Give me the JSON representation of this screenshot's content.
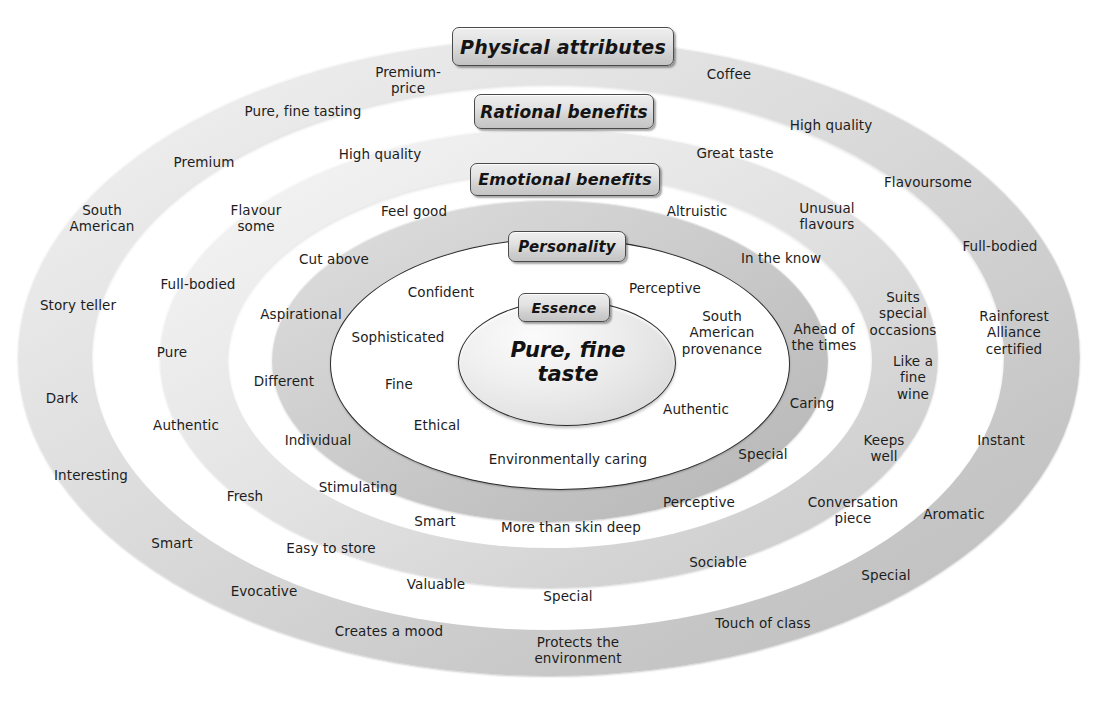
{
  "diagram": {
    "type": "concentric-ellipse-brand-model",
    "core_text": "Pure, fine\ntaste",
    "layer_labels": {
      "physical": "Physical attributes",
      "rational": "Rational benefits",
      "emotional": "Emotional benefits",
      "personality": "Personality",
      "essence": "Essence"
    },
    "colors": {
      "outer_band": "#d9d9d9",
      "rational_band": "#e2e2e2",
      "emotional_band": "#c9c9c9",
      "personality_fill": "#ffffff",
      "essence_fill": "#e6e6e6",
      "label_box": "#d8d8d8",
      "text": "#1d1d1d",
      "outline": "#2b2b2b"
    },
    "layers": [
      {
        "name": "essence",
        "label": "Essence",
        "words": [
          "Pure, fine taste"
        ]
      },
      {
        "name": "personality",
        "label": "Personality",
        "words": [
          "Confident",
          "Perceptive",
          "Sophisticated",
          "South\nAmerican\nprovenance",
          "Fine",
          "Ethical",
          "Authentic",
          "Environmentally caring"
        ]
      },
      {
        "name": "emotional",
        "label": "Emotional benefits",
        "words": [
          "Cut above",
          "Aspirational",
          "Different",
          "Individual",
          "Stimulating",
          "Smart",
          "More than skin deep",
          "Perceptive",
          "Special",
          "Caring",
          "Ahead of\nthe times",
          "In the know"
        ]
      },
      {
        "name": "emotional_gap",
        "label": "",
        "words": [
          "Feel good",
          "Altruistic",
          "Flavour\nsome",
          "Unusual\nflavours",
          "High quality",
          "Great taste"
        ]
      },
      {
        "name": "rational",
        "label": "Rational benefits",
        "words": [
          "Premium-\nprice",
          "Coffee",
          "Pure, fine tasting",
          "High quality",
          "Flavoursome",
          "Suits\nspecial\noccasions",
          "Like a\nfine\nwine",
          "Keeps\nwell",
          "Conversation\npiece",
          "Sociable",
          "Special",
          "Valuable",
          "Easy to store",
          "Fresh",
          "Authentic",
          "Pure",
          "Full-bodied",
          "Premium"
        ]
      },
      {
        "name": "physical",
        "label": "Physical attributes",
        "words": [
          "South\nAmerican",
          "Story teller",
          "Dark",
          "Interesting",
          "Smart",
          "Evocative",
          "Creates a mood",
          "Protects the\nenvironment",
          "Touch of class",
          "Special",
          "Aromatic",
          "Instant",
          "Rainforest\nAlliance\ncertified",
          "Full-bodied",
          "Flavoursome"
        ]
      }
    ],
    "word_placements": [
      {
        "id": "w-premium-price",
        "text": "Premium-\nprice",
        "x": 408,
        "y": 80,
        "ring": "physical"
      },
      {
        "id": "w-coffee",
        "text": "Coffee",
        "x": 729,
        "y": 74,
        "ring": "physical"
      },
      {
        "id": "w-pure-fine-tasting",
        "text": "Pure, fine tasting",
        "x": 303,
        "y": 111,
        "ring": "physical"
      },
      {
        "id": "w-high-quality-r",
        "text": "High quality",
        "x": 831,
        "y": 125,
        "ring": "physical"
      },
      {
        "id": "w-premium",
        "text": "Premium",
        "x": 204,
        "y": 162,
        "ring": "physical"
      },
      {
        "id": "w-high-quality-l",
        "text": "High quality",
        "x": 380,
        "y": 154,
        "ring": "rational"
      },
      {
        "id": "w-great-taste",
        "text": "Great taste",
        "x": 735,
        "y": 153,
        "ring": "rational"
      },
      {
        "id": "w-flavoursome-out",
        "text": "Flavoursome",
        "x": 928,
        "y": 182,
        "ring": "physical"
      },
      {
        "id": "w-south-american-out",
        "text": "South\nAmerican",
        "x": 102,
        "y": 218,
        "ring": "physical"
      },
      {
        "id": "w-flavour-some",
        "text": "Flavour\nsome",
        "x": 256,
        "y": 218,
        "ring": "rational"
      },
      {
        "id": "w-feel-good",
        "text": "Feel good",
        "x": 414,
        "y": 211,
        "ring": "rational"
      },
      {
        "id": "w-altruistic",
        "text": "Altruistic",
        "x": 697,
        "y": 211,
        "ring": "rational"
      },
      {
        "id": "w-unusual-flavours",
        "text": "Unusual\nflavours",
        "x": 827,
        "y": 216,
        "ring": "rational"
      },
      {
        "id": "w-full-bodied-out",
        "text": "Full-bodied",
        "x": 1000,
        "y": 246,
        "ring": "physical"
      },
      {
        "id": "w-cut-above",
        "text": "Cut above",
        "x": 334,
        "y": 259,
        "ring": "emotional"
      },
      {
        "id": "w-in-the-know",
        "text": "In the know",
        "x": 781,
        "y": 258,
        "ring": "emotional"
      },
      {
        "id": "w-story-teller",
        "text": "Story teller",
        "x": 78,
        "y": 305,
        "ring": "physical"
      },
      {
        "id": "w-full-bodied-mid",
        "text": "Full-bodied",
        "x": 198,
        "y": 284,
        "ring": "rational"
      },
      {
        "id": "w-confident",
        "text": "Confident",
        "x": 441,
        "y": 292,
        "ring": "personality"
      },
      {
        "id": "w-perceptive-in",
        "text": "Perceptive",
        "x": 665,
        "y": 288,
        "ring": "personality"
      },
      {
        "id": "w-aspirational",
        "text": "Aspirational",
        "x": 301,
        "y": 314,
        "ring": "emotional"
      },
      {
        "id": "w-suits-special",
        "text": "Suits\nspecial\noccasions",
        "x": 903,
        "y": 314,
        "ring": "rational"
      },
      {
        "id": "w-rainforest",
        "text": "Rainforest\nAlliance\ncertified",
        "x": 1014,
        "y": 333,
        "ring": "physical"
      },
      {
        "id": "w-sophisticated",
        "text": "Sophisticated",
        "x": 398,
        "y": 337,
        "ring": "personality"
      },
      {
        "id": "w-south-am-prov",
        "text": "South\nAmerican\nprovenance",
        "x": 722,
        "y": 333,
        "ring": "personality"
      },
      {
        "id": "w-ahead-of-times",
        "text": "Ahead of\nthe times",
        "x": 824,
        "y": 337,
        "ring": "emotional"
      },
      {
        "id": "w-pure",
        "text": "Pure",
        "x": 172,
        "y": 352,
        "ring": "rational"
      },
      {
        "id": "w-dark",
        "text": "Dark",
        "x": 62,
        "y": 398,
        "ring": "physical"
      },
      {
        "id": "w-different",
        "text": "Different",
        "x": 284,
        "y": 381,
        "ring": "emotional"
      },
      {
        "id": "w-fine",
        "text": "Fine",
        "x": 399,
        "y": 384,
        "ring": "personality"
      },
      {
        "id": "w-like-fine-wine",
        "text": "Like a\nfine\nwine",
        "x": 913,
        "y": 378,
        "ring": "rational"
      },
      {
        "id": "w-ethical",
        "text": "Ethical",
        "x": 437,
        "y": 425,
        "ring": "personality"
      },
      {
        "id": "w-authentic-in",
        "text": "Authentic",
        "x": 696,
        "y": 409,
        "ring": "personality"
      },
      {
        "id": "w-caring",
        "text": "Caring",
        "x": 812,
        "y": 403,
        "ring": "emotional"
      },
      {
        "id": "w-authentic-mid",
        "text": "Authentic",
        "x": 186,
        "y": 425,
        "ring": "rational"
      },
      {
        "id": "w-individual",
        "text": "Individual",
        "x": 318,
        "y": 440,
        "ring": "emotional"
      },
      {
        "id": "w-instant",
        "text": "Instant",
        "x": 1001,
        "y": 440,
        "ring": "physical"
      },
      {
        "id": "w-env-caring",
        "text": "Environmentally caring",
        "x": 568,
        "y": 459,
        "ring": "personality"
      },
      {
        "id": "w-special-emo",
        "text": "Special",
        "x": 763,
        "y": 454,
        "ring": "emotional"
      },
      {
        "id": "w-keeps-well",
        "text": "Keeps\nwell",
        "x": 884,
        "y": 448,
        "ring": "rational"
      },
      {
        "id": "w-interesting",
        "text": "Interesting",
        "x": 91,
        "y": 475,
        "ring": "physical"
      },
      {
        "id": "w-stimulating",
        "text": "Stimulating",
        "x": 358,
        "y": 487,
        "ring": "emotional"
      },
      {
        "id": "w-fresh",
        "text": "Fresh",
        "x": 245,
        "y": 496,
        "ring": "rational"
      },
      {
        "id": "w-perceptive-emo",
        "text": "Perceptive",
        "x": 699,
        "y": 502,
        "ring": "emotional"
      },
      {
        "id": "w-conversation",
        "text": "Conversation\npiece",
        "x": 853,
        "y": 510,
        "ring": "rational"
      },
      {
        "id": "w-aromatic",
        "text": "Aromatic",
        "x": 954,
        "y": 514,
        "ring": "physical"
      },
      {
        "id": "w-smart-emo",
        "text": "Smart",
        "x": 435,
        "y": 521,
        "ring": "emotional"
      },
      {
        "id": "w-more-than-skin",
        "text": "More than skin deep",
        "x": 571,
        "y": 527,
        "ring": "emotional"
      },
      {
        "id": "w-smart-out",
        "text": "Smart",
        "x": 172,
        "y": 543,
        "ring": "physical"
      },
      {
        "id": "w-easy-to-store",
        "text": "Easy to store",
        "x": 331,
        "y": 548,
        "ring": "rational"
      },
      {
        "id": "w-sociable",
        "text": "Sociable",
        "x": 718,
        "y": 562,
        "ring": "rational"
      },
      {
        "id": "w-special-out-r",
        "text": "Special",
        "x": 886,
        "y": 575,
        "ring": "physical"
      },
      {
        "id": "w-evocative",
        "text": "Evocative",
        "x": 264,
        "y": 591,
        "ring": "physical"
      },
      {
        "id": "w-valuable",
        "text": "Valuable",
        "x": 436,
        "y": 584,
        "ring": "rational"
      },
      {
        "id": "w-special-rat",
        "text": "Special",
        "x": 568,
        "y": 596,
        "ring": "rational"
      },
      {
        "id": "w-touch-of-class",
        "text": "Touch of class",
        "x": 763,
        "y": 623,
        "ring": "physical"
      },
      {
        "id": "w-creates-a-mood",
        "text": "Creates a mood",
        "x": 389,
        "y": 631,
        "ring": "physical"
      },
      {
        "id": "w-protects-env",
        "text": "Protects the\nenvironment",
        "x": 578,
        "y": 650,
        "ring": "physical"
      }
    ]
  }
}
